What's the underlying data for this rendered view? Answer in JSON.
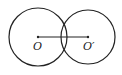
{
  "diagram": {
    "type": "two intersecting circles",
    "background": "#ffffff",
    "stroke_color": "#222222",
    "circles": [
      {
        "name": "circle-o",
        "center_label": "O",
        "cx": 38,
        "cy": 37,
        "r": 29
      },
      {
        "name": "circle-o-prime",
        "center_label": "O′",
        "cx": 88,
        "cy": 37,
        "r": 27
      }
    ],
    "segment": {
      "from": "O",
      "to": "O′",
      "x1": 38,
      "y1": 37,
      "x2": 88,
      "y2": 37
    },
    "labels": {
      "o": "O",
      "o_prime": "O′"
    }
  }
}
